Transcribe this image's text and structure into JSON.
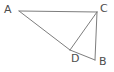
{
  "figure": {
    "type": "geometry-diagram",
    "canvas": {
      "width": 114,
      "height": 72,
      "background": "#ffffff"
    },
    "stroke": {
      "color": "#7d7d7d",
      "width": 1
    },
    "label_color": "#4d4d4d",
    "vertices": [
      {
        "id": "A",
        "label": "A",
        "x": 19,
        "y": 11,
        "label_x": 4,
        "label_y": 4
      },
      {
        "id": "C",
        "label": "C",
        "x": 97,
        "y": 12,
        "label_x": 100,
        "label_y": 3
      },
      {
        "id": "D",
        "label": "D",
        "x": 70,
        "y": 50,
        "label_x": 71,
        "label_y": 53
      },
      {
        "id": "B",
        "label": "B",
        "x": 95,
        "y": 60,
        "label_x": 99,
        "label_y": 56
      }
    ],
    "segments": [
      {
        "id": "AC",
        "from": "A",
        "to": "C",
        "x1": 19,
        "y1": 11,
        "x2": 97,
        "y2": 12
      },
      {
        "id": "AD",
        "from": "A",
        "to": "D",
        "x1": 19,
        "y1": 11,
        "x2": 70,
        "y2": 50
      },
      {
        "id": "CD",
        "from": "C",
        "to": "D",
        "x1": 97,
        "y1": 12,
        "x2": 70,
        "y2": 50
      },
      {
        "id": "CB",
        "from": "C",
        "to": "B",
        "x1": 97,
        "y1": 12,
        "x2": 95,
        "y2": 60
      },
      {
        "id": "DB",
        "from": "D",
        "to": "B",
        "x1": 70,
        "y1": 50,
        "x2": 95,
        "y2": 60
      }
    ]
  }
}
